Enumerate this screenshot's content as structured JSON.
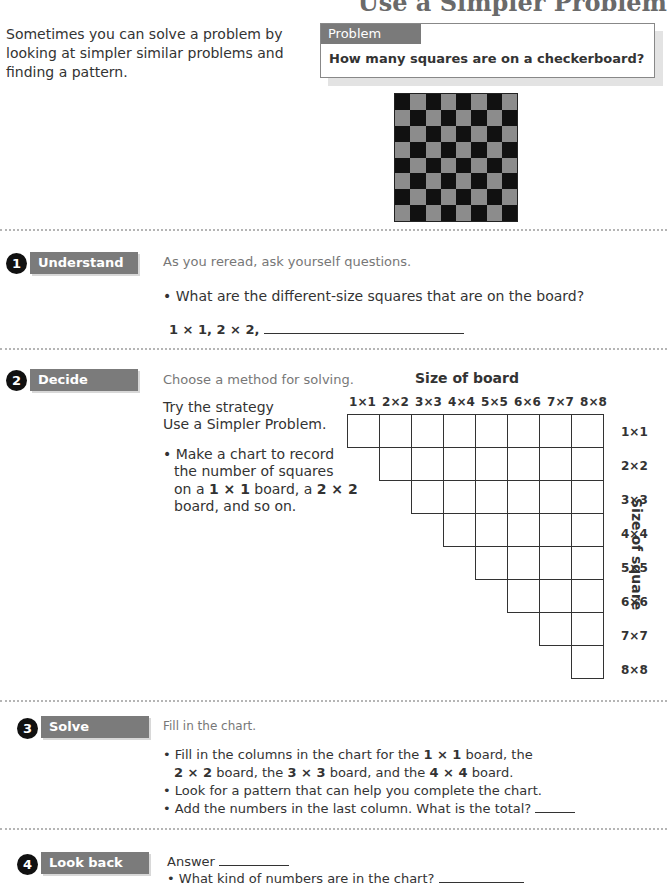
{
  "page": {
    "title": "Use a Simpler Problem",
    "intro": "Sometimes you can solve a problem by looking at simpler similar problems and finding a pattern.",
    "problem": {
      "tab_label": "Problem",
      "question": "How many squares are on a checkerboard?"
    },
    "checkerboard": {
      "rows": 8,
      "cols": 8,
      "dark_color": "#111111",
      "light_color": "#8c8c8c"
    }
  },
  "steps": [
    {
      "number": "1",
      "label": "Understand",
      "heading": "As you reread, ask yourself questions.",
      "bullet": "• What are the different-size squares that are on the board?",
      "answer_prefix": "1 × 1, 2 × 2,"
    },
    {
      "number": "2",
      "label": "Decide",
      "heading": "Choose a method for solving.",
      "strategy_line1": "Try the strategy",
      "strategy_line2": "Use a Simpler Problem.",
      "bullet_line1": "• Make a chart to record",
      "bullet_line2": "the number of squares",
      "bullet_line3_a": "on a ",
      "bullet_line3_b": "1 × 1",
      "bullet_line3_c": " board, a ",
      "bullet_line3_d": "2 × 2",
      "bullet_line4": "board, and so on."
    },
    {
      "number": "3",
      "label": "Solve",
      "heading": "Fill in the chart.",
      "b1_a": "• Fill in the columns in the chart for the ",
      "b1_b": "1 × 1",
      "b1_c": " board, the",
      "b2_a": "2 × 2",
      "b2_b": " board, the ",
      "b2_c": "3 × 3",
      "b2_d": " board, and the ",
      "b2_e": "4 × 4",
      "b2_f": " board.",
      "b3": "• Look for a pattern that can help you complete the chart.",
      "b4": "• Add the numbers in the last column. What is the total?"
    },
    {
      "number": "4",
      "label": "Look back",
      "answer_label": "Answer",
      "bullet": "• What kind of numbers are in the chart?"
    }
  ],
  "chart": {
    "title": "Size of board",
    "row_axis_label": "Size of square",
    "columns": [
      "1×1",
      "2×2",
      "3×3",
      "4×4",
      "5×5",
      "6×6",
      "7×7",
      "8×8"
    ],
    "rows": [
      "1×1",
      "2×2",
      "3×3",
      "4×4",
      "5×5",
      "6×6",
      "7×7",
      "8×8"
    ]
  }
}
